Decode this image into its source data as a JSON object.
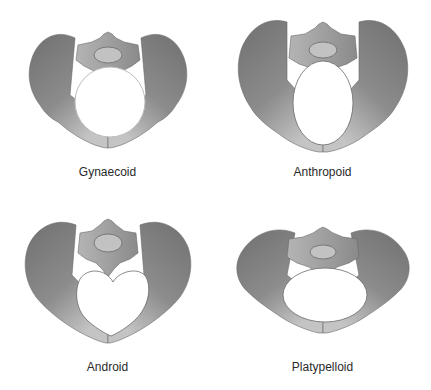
{
  "figure": {
    "colors": {
      "ilium_dark": "#7e7e7e",
      "ilium_light": "#b8b8b8",
      "sacrum": "#a8a8a8",
      "outline": "#6a6a6a",
      "inlet_fill": "#ffffff",
      "inlet_stroke_light": "#bdbdbd",
      "background": "#ffffff"
    },
    "panels": [
      {
        "label": "Gynaecoid",
        "inlet_shape": "round"
      },
      {
        "label": "Anthropoid",
        "inlet_shape": "oval-vertical"
      },
      {
        "label": "Android",
        "inlet_shape": "heart"
      },
      {
        "label": "Platypelloid",
        "inlet_shape": "oval-horizontal"
      }
    ]
  }
}
